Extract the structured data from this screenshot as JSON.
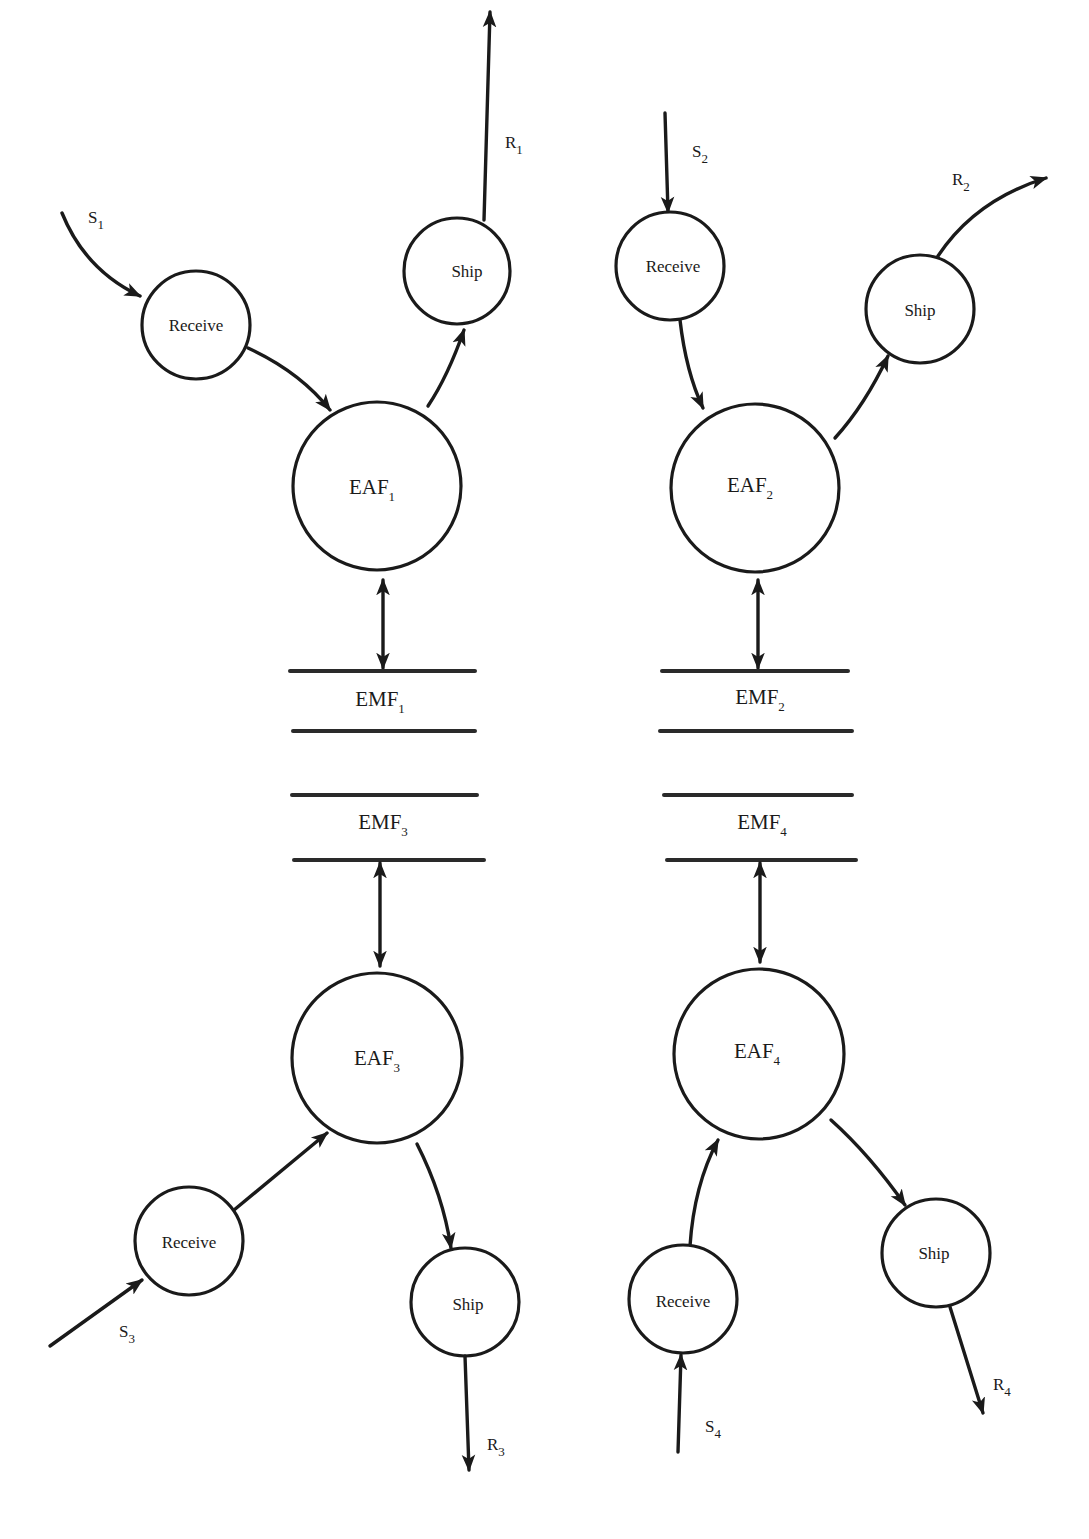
{
  "diagram": {
    "type": "data-flow",
    "quadrants": [
      {
        "id": 1,
        "supply_label": "S",
        "supply_sub": "1",
        "receive_label": "Receive",
        "eaf_label": "EAF",
        "eaf_sub": "1",
        "ship_label": "Ship",
        "result_label": "R",
        "result_sub": "1",
        "emf_label": "EMF",
        "emf_sub": "1"
      },
      {
        "id": 2,
        "supply_label": "S",
        "supply_sub": "2",
        "receive_label": "Receive",
        "eaf_label": "EAF",
        "eaf_sub": "2",
        "ship_label": "Ship",
        "result_label": "R",
        "result_sub": "2",
        "emf_label": "EMF",
        "emf_sub": "2"
      },
      {
        "id": 3,
        "supply_label": "S",
        "supply_sub": "3",
        "receive_label": "Receive",
        "eaf_label": "EAF",
        "eaf_sub": "3",
        "ship_label": "Ship",
        "result_label": "R",
        "result_sub": "3",
        "emf_label": "EMF",
        "emf_sub": "3"
      },
      {
        "id": 4,
        "supply_label": "S",
        "supply_sub": "4",
        "receive_label": "Receive",
        "eaf_label": "EAF",
        "eaf_sub": "4",
        "ship_label": "Ship",
        "result_label": "R",
        "result_sub": "4",
        "emf_label": "EMF",
        "emf_sub": "4"
      }
    ],
    "colors": {
      "stroke": "#1a1a1a",
      "background": "#ffffff"
    }
  }
}
